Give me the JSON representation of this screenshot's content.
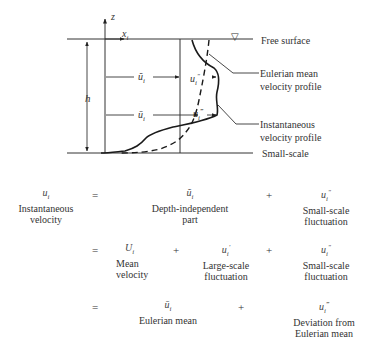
{
  "diagram": {
    "axis_z_label": "z",
    "axis_x_label": "x_i",
    "depth_label": "h",
    "arrow_depth_independent_label": "ũ_i",
    "arrow_eulerian_label": "ū_i",
    "small_scale_label": "u_i''",
    "deviation_label": "u_i'''",
    "free_surface_symbol": "▽",
    "callouts": {
      "free_surface": "Free surface",
      "eulerian_mean_line1": "Eulerian mean",
      "eulerian_mean_line2": "velocity profile",
      "instantaneous_line1": "Instantaneous",
      "instantaneous_line2": "velocity profile",
      "small_scale": "Small-scale"
    }
  },
  "equations": {
    "row1": {
      "lhs_symbol": "u_i",
      "lhs_desc_line1": "Instantaneous",
      "lhs_desc_line2": "velocity",
      "equals": "=",
      "term1_symbol": "ũ_i",
      "term1_desc_line1": "Depth-independent",
      "term1_desc_line2": "part",
      "plus1": "+",
      "term2_symbol": "u_i''",
      "term2_desc_line1": "Small-scale",
      "term2_desc_line2": "fluctuation"
    },
    "row2": {
      "equals": "=",
      "term1_symbol": "U_i",
      "term1_desc_line1": "Mean",
      "term1_desc_line2": "velocity",
      "plus1": "+",
      "term2_symbol": "u_i'",
      "term2_desc_line1": "Large-scale",
      "term2_desc_line2": "fluctuation",
      "plus2": "+",
      "term3_symbol": "u_i''",
      "term3_desc_line1": "Small-scale",
      "term3_desc_line2": "fluctuation"
    },
    "row3": {
      "equals": "=",
      "term1_symbol": "ū_i",
      "term1_desc_line1": "Eulerian mean",
      "plus1": "+",
      "term2_symbol": "u_i'''",
      "term2_desc_line1": "Deviation from",
      "term2_desc_line2": "Eulerian mean"
    }
  }
}
